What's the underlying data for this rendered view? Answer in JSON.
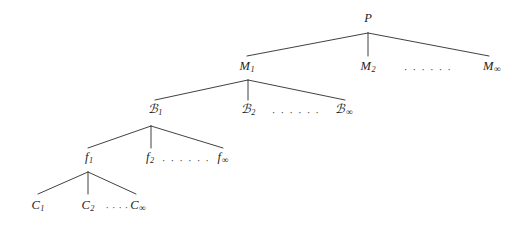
{
  "diagram": {
    "type": "tree",
    "background_color": "#ffffff",
    "line_color": "#2b2b2b",
    "text_color": "#1d1d1d",
    "levels": [
      {
        "name": "root",
        "nodes": [
          {
            "id": "P",
            "base": "P",
            "sub": "",
            "x": 368,
            "y": 18
          }
        ]
      },
      {
        "name": "level-M",
        "nodes": [
          {
            "id": "M1",
            "base": "M",
            "sub": "1",
            "x": 247,
            "y": 67
          },
          {
            "id": "M2",
            "base": "M",
            "sub": "2",
            "x": 368,
            "y": 67
          },
          {
            "id": "Minf",
            "base": "M",
            "sub": "∞",
            "x": 492,
            "y": 67
          }
        ],
        "ellipsis": {
          "text": "· · · · · ·",
          "x": 428,
          "y": 69
        }
      },
      {
        "name": "level-A",
        "nodes": [
          {
            "id": "A1",
            "base": "ᴀ",
            "cal": "ℬ",
            "sub": "1",
            "x": 155,
            "y": 110
          },
          {
            "id": "A2",
            "base": "ᴀ",
            "cal": "ℬ",
            "sub": "2",
            "x": 248,
            "y": 110
          },
          {
            "id": "Ainf",
            "base": "ᴀ",
            "cal": "ℬ",
            "sub": "∞",
            "x": 344,
            "y": 110
          }
        ],
        "ellipsis": {
          "text": "· · · · · ·",
          "x": 296,
          "y": 112
        }
      },
      {
        "name": "level-f",
        "nodes": [
          {
            "id": "f1",
            "base": "f",
            "sub": "1",
            "x": 89,
            "y": 158
          },
          {
            "id": "f2",
            "base": "f",
            "sub": "2",
            "x": 150,
            "y": 158
          },
          {
            "id": "finf",
            "base": "f",
            "sub": "∞",
            "x": 223,
            "y": 158
          }
        ],
        "ellipsis": {
          "text": "· · · · · ·",
          "x": 186,
          "y": 160
        }
      },
      {
        "name": "level-C",
        "nodes": [
          {
            "id": "C1",
            "base": "C",
            "sub": "1",
            "x": 38,
            "y": 206
          },
          {
            "id": "C2",
            "base": "C",
            "sub": "2",
            "x": 88,
            "y": 206
          },
          {
            "id": "Cinf",
            "base": "C",
            "sub": "∞",
            "x": 138,
            "y": 206
          }
        ],
        "ellipsis": {
          "text": "· · · ·",
          "x": 117,
          "y": 207
        }
      }
    ],
    "edges": [
      {
        "from": "P",
        "to": "M1",
        "x1": 368,
        "y1": 33,
        "x2": 247,
        "y2": 56
      },
      {
        "from": "P",
        "to": "M2",
        "x1": 368,
        "y1": 33,
        "x2": 368,
        "y2": 56
      },
      {
        "from": "P",
        "to": "Minf",
        "x1": 368,
        "y1": 33,
        "x2": 489,
        "y2": 56
      },
      {
        "from": "M1",
        "to": "A1",
        "x1": 248,
        "y1": 80,
        "x2": 155,
        "y2": 100
      },
      {
        "from": "M1",
        "to": "A2",
        "x1": 248,
        "y1": 80,
        "x2": 248,
        "y2": 100
      },
      {
        "from": "M1",
        "to": "Ainf",
        "x1": 248,
        "y1": 80,
        "x2": 345,
        "y2": 100
      },
      {
        "from": "A1",
        "to": "f1",
        "x1": 151,
        "y1": 126,
        "x2": 88,
        "y2": 148
      },
      {
        "from": "A1",
        "to": "f2",
        "x1": 151,
        "y1": 126,
        "x2": 151,
        "y2": 148
      },
      {
        "from": "A1",
        "to": "finf",
        "x1": 151,
        "y1": 126,
        "x2": 223,
        "y2": 148
      },
      {
        "from": "f1",
        "to": "C1",
        "x1": 88,
        "y1": 172,
        "x2": 38,
        "y2": 194
      },
      {
        "from": "f1",
        "to": "C2",
        "x1": 88,
        "y1": 172,
        "x2": 88,
        "y2": 194
      },
      {
        "from": "f1",
        "to": "Cinf",
        "x1": 88,
        "y1": 172,
        "x2": 136,
        "y2": 194
      }
    ]
  }
}
